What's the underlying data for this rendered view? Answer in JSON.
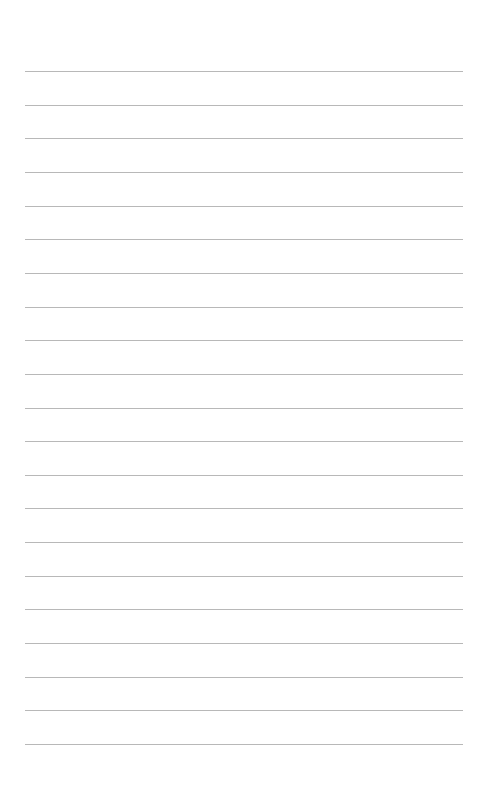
{
  "page": {
    "type": "lined-paper",
    "line_count": 21,
    "line_color": "#b8b8b8",
    "first_line_y": 71,
    "line_spacing": 33.65,
    "line_left": 25,
    "line_width": 438
  }
}
